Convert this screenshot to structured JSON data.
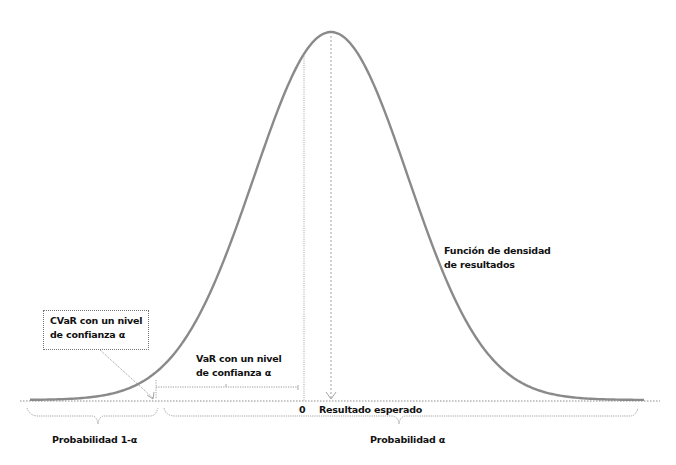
{
  "diagram": {
    "title": "",
    "curve_label_line1": "Función de densidad",
    "curve_label_line2": "de resultados",
    "cvar_label_line1": "CVaR con un nivel",
    "cvar_label_line2": "de confianza  α",
    "var_label_line1": "VaR con un nivel",
    "var_label_line2": "de confianza  α",
    "zero_label": "0",
    "expected_label": "Resultado esperado",
    "left_prob_label": "Probabilidad  1-α",
    "right_prob_label": "Probabilidad  α",
    "colors": {
      "curve": "#8a8a8a",
      "dotted": "#8c8c8c",
      "text": "#111111"
    }
  },
  "chart_data": {
    "type": "line",
    "title": "",
    "distribution": "normal",
    "xlabel": "Resultado",
    "ylabel": "Densidad",
    "annotations": [
      "Función de densidad de resultados",
      "CVaR con un nivel de confianza α",
      "VaR con un nivel de confianza α",
      "0",
      "Resultado esperado",
      "Probabilidad 1-α",
      "Probabilidad α"
    ],
    "grid": false
  }
}
